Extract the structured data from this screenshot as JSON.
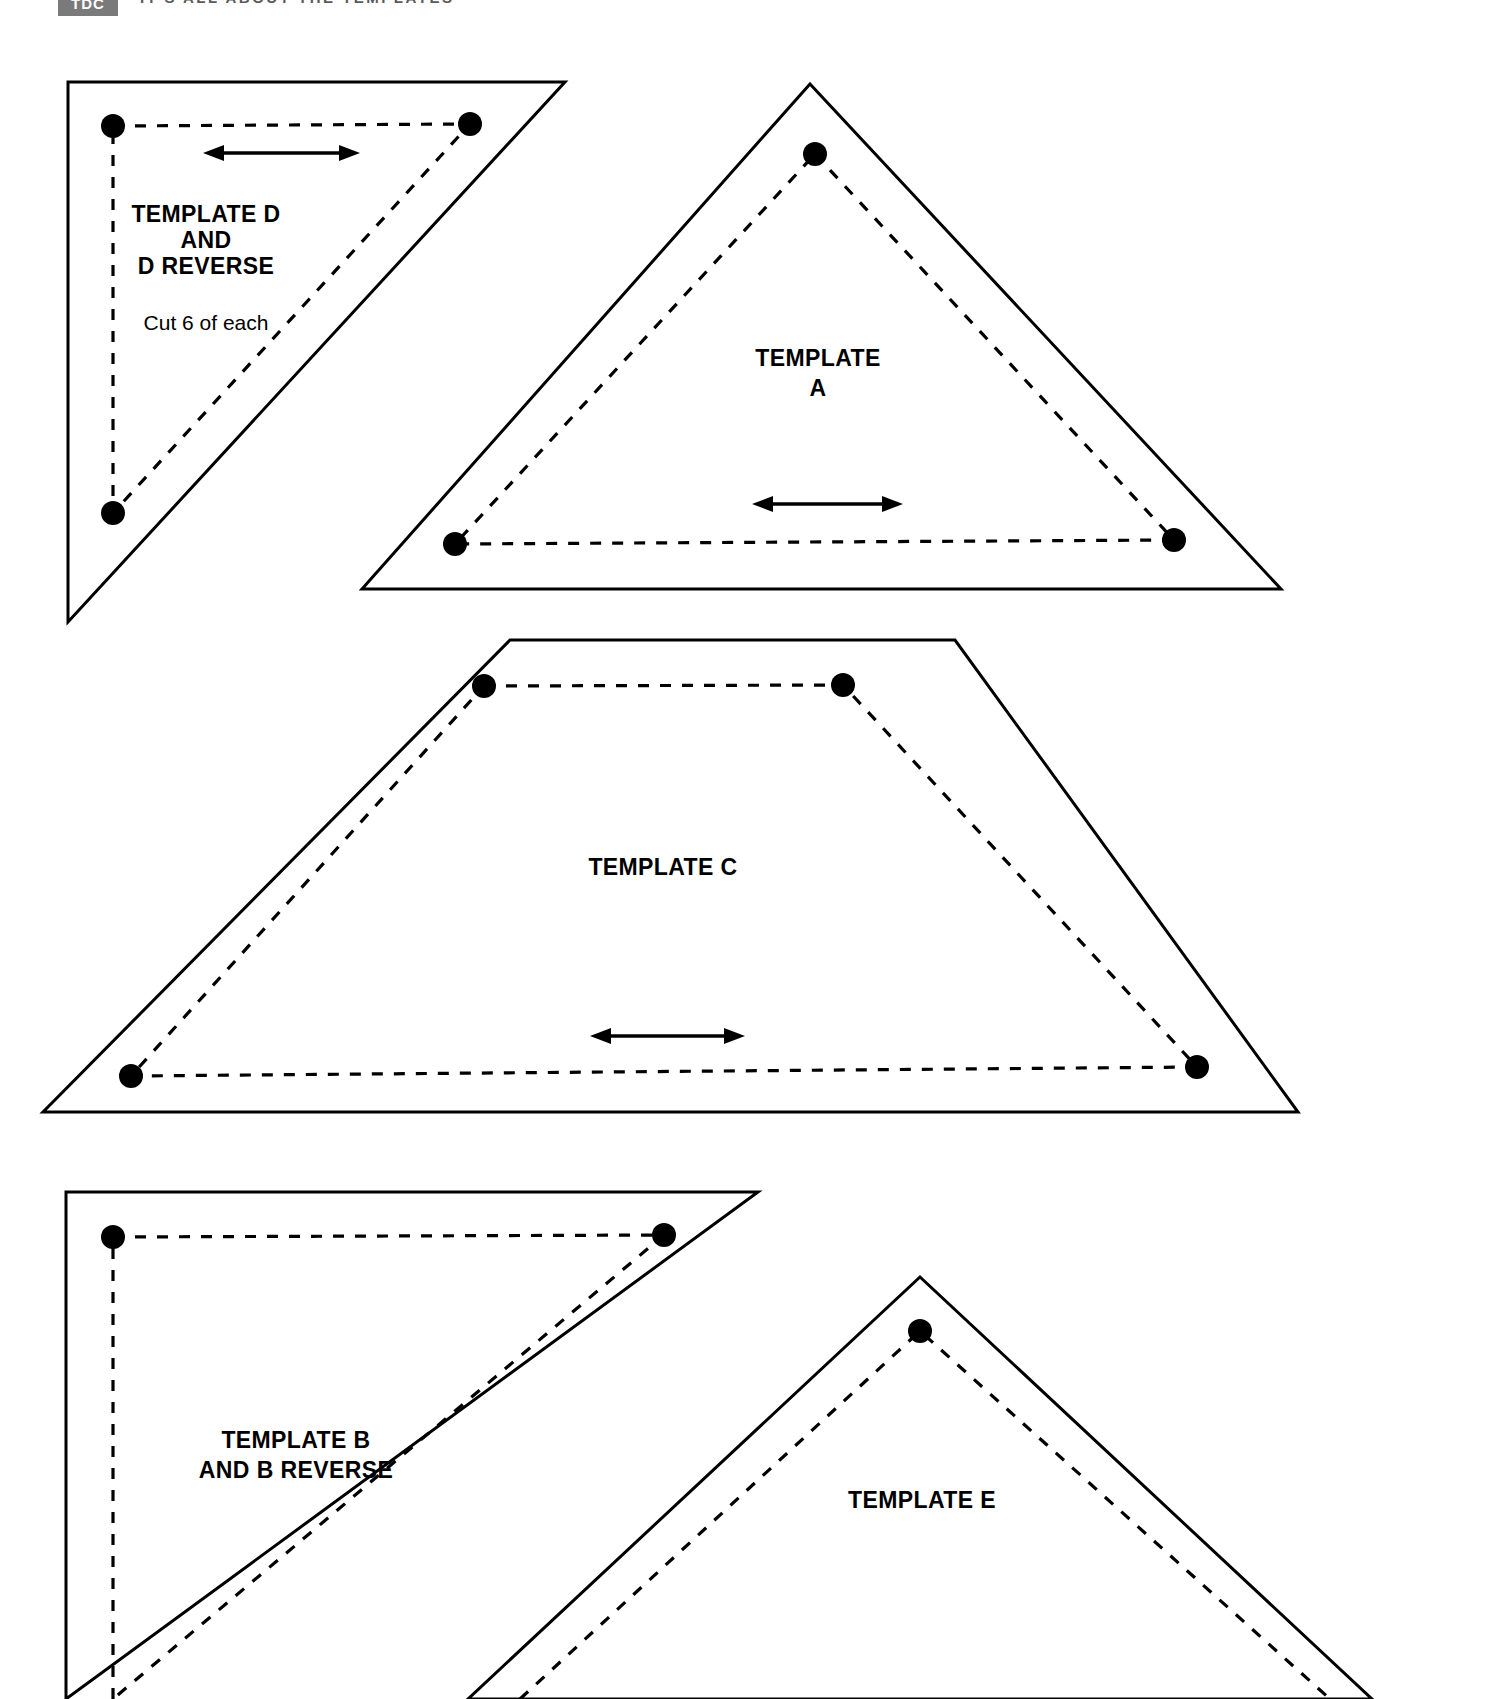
{
  "header": {
    "logo_text": "TDC",
    "title": "IT'S ALL ABOUT THE TEMPLATES"
  },
  "page": {
    "width": 1500,
    "height": 1699,
    "background_color": "#ffffff",
    "line_color": "#000000",
    "logo_color": "#7a7a7a"
  },
  "templates": [
    {
      "id": "template-d",
      "label_lines": [
        "TEMPLATE D",
        "AND",
        "D REVERSE"
      ],
      "note": "Cut 6 of each",
      "shape": "right-triangle",
      "cut_points": "68,82 565,82 68,622",
      "seam_points": "113,126 470,126 113,513",
      "dots": [
        {
          "cx": 113,
          "cy": 126,
          "r": 12
        },
        {
          "cx": 470,
          "cy": 124,
          "r": 12
        },
        {
          "cx": 113,
          "cy": 513,
          "r": 12
        }
      ],
      "label_x": 206,
      "label_y": 222,
      "label_line_height": 26,
      "note_x": 206,
      "note_y": 330,
      "grain_arrow": {
        "x1": 205,
        "y1": 153,
        "x2": 358,
        "y2": 153
      }
    },
    {
      "id": "template-a",
      "label_lines": [
        "TEMPLATE",
        "A"
      ],
      "note": "",
      "shape": "triangle",
      "cut_points": "810,84 1281,589 362,589",
      "seam_points": "815,154 1175,540 454,544",
      "dots": [
        {
          "cx": 815,
          "cy": 154,
          "r": 12
        },
        {
          "cx": 1174,
          "cy": 540,
          "r": 12
        },
        {
          "cx": 455,
          "cy": 544,
          "r": 12
        }
      ],
      "label_x": 818,
      "label_y": 366,
      "label_line_height": 28,
      "note_x": 0,
      "note_y": 0,
      "grain_arrow": {
        "x1": 755,
        "y1": 504,
        "x2": 900,
        "y2": 504
      }
    },
    {
      "id": "template-c",
      "label_lines": [
        "TEMPLATE C"
      ],
      "note": "",
      "shape": "trapezoid",
      "cut_points": "510,640 955,640 1298,1112 43,1112",
      "seam_points": "484,686 843,686 1197,1067 130,1075",
      "dots": [
        {
          "cx": 484,
          "cy": 686,
          "r": 12
        },
        {
          "cx": 843,
          "cy": 685,
          "r": 12
        },
        {
          "cx": 1197,
          "cy": 1067,
          "r": 12
        },
        {
          "cx": 131,
          "cy": 1076,
          "r": 12
        }
      ],
      "label_x": 663,
      "label_y": 875,
      "label_line_height": 26,
      "note_x": 0,
      "note_y": 0,
      "grain_arrow": {
        "x1": 592,
        "y1": 1036,
        "x2": 742,
        "y2": 1036
      }
    },
    {
      "id": "template-b",
      "label_lines": [
        "TEMPLATE B",
        "AND B REVERSE"
      ],
      "note": "",
      "shape": "right-triangle-b",
      "cut_points": "66,1192 758,1192 66,1699",
      "seam_points": "113,1237 665,1237 113,1699",
      "dots": [
        {
          "cx": 113,
          "cy": 1237,
          "r": 12
        },
        {
          "cx": 664,
          "cy": 1235,
          "r": 12
        }
      ],
      "label_x": 206,
      "label_y": 1448,
      "label_line_height": 28,
      "note_x": 0,
      "note_y": 0,
      "grain_arrow": null
    },
    {
      "id": "template-e",
      "label_lines": [
        "TEMPLATE E"
      ],
      "note": "",
      "shape": "triangle-e",
      "cut_points": "920,1277 1372,1699 468,1699",
      "seam_points": "920,1331 1330,1699 520,1699",
      "dots": [
        {
          "cx": 920,
          "cy": 1331,
          "r": 12
        }
      ],
      "label_x": 922,
      "label_y": 1508,
      "label_line_height": 26,
      "note_x": 0,
      "note_y": 0,
      "grain_arrow": null
    }
  ]
}
